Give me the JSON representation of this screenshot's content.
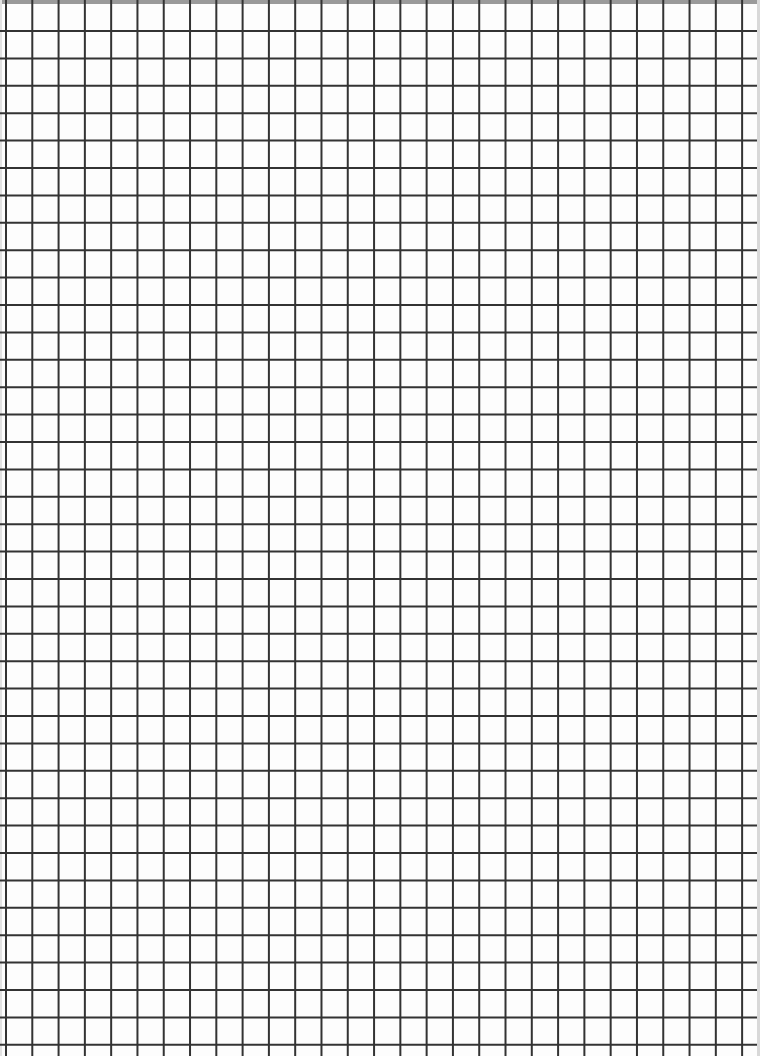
{
  "sheet": {
    "type": "grid-paper",
    "background": "#fdfdfd",
    "line_color": "#333333",
    "line_width": 2,
    "grid": {
      "x_start": 6,
      "x_step": 26.29,
      "columns": 28,
      "y_start": 31,
      "y_step": 27.4,
      "rows": 37
    }
  }
}
